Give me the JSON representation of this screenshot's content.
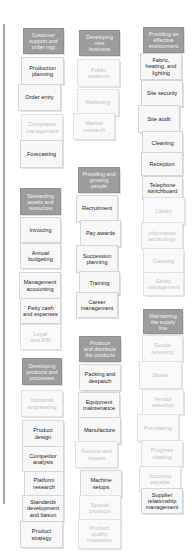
{
  "colors": {
    "header_bg": "#9c9c9c",
    "card_bg": "#f7f7f7",
    "active_text": "#1e1e1e",
    "faded_text": "#c2c2c2",
    "rule": "#a8a8a8"
  },
  "groups": [
    {
      "id": "customer",
      "header": "Customer\nsupport and\norder mgt",
      "items": [
        {
          "label": "Production\nplanning",
          "state": "active"
        },
        {
          "label": "Order entry",
          "state": "active"
        },
        {
          "label": "Complaints\nmanagement",
          "state": "faded"
        },
        {
          "label": "Forecasting",
          "state": "active"
        }
      ]
    },
    {
      "id": "new-business",
      "header": "Developing\nnew\nbusiness",
      "items": [
        {
          "label": "Public\nrelations",
          "state": "faded"
        },
        {
          "label": "Marketing",
          "state": "faded"
        },
        {
          "label": "Market\nresearch",
          "state": "faded"
        }
      ]
    },
    {
      "id": "environment",
      "header": "Providing an\neffective\nenvironment",
      "items": [
        {
          "label": "Fabric,\nheating, and\nlighting",
          "state": "active"
        },
        {
          "label": "Site security",
          "state": "active"
        },
        {
          "label": "Site audit",
          "state": "active"
        },
        {
          "label": "Cleaning",
          "state": "active"
        },
        {
          "label": "Reception",
          "state": "active"
        },
        {
          "label": "Telephone\nswitchboard",
          "state": "active"
        },
        {
          "label": "Library",
          "state": "faded"
        },
        {
          "label": "Information\ntechnology",
          "state": "faded"
        },
        {
          "label": "Catering",
          "state": "faded"
        },
        {
          "label": "Safety\nmanagement",
          "state": "faded"
        }
      ]
    },
    {
      "id": "stewarding",
      "header": "Stewarding\nassets and\nresources",
      "items": [
        {
          "label": "Invoicing",
          "state": "active"
        },
        {
          "label": "Annual\nbudgeting",
          "state": "active"
        },
        {
          "label": "Management\naccounting",
          "state": "active"
        },
        {
          "label": "Petty cash\nand expenses",
          "state": "active"
        },
        {
          "label": "Legal\nand IPR",
          "state": "faded"
        }
      ]
    },
    {
      "id": "people",
      "header": "Providing and\ngrowing\npeople",
      "items": [
        {
          "label": "Recruitment",
          "state": "active"
        },
        {
          "label": "Pay awards",
          "state": "active"
        },
        {
          "label": "Succession\nplanning",
          "state": "active"
        },
        {
          "label": "Training",
          "state": "active"
        },
        {
          "label": "Career\nmanagement",
          "state": "active"
        }
      ]
    },
    {
      "id": "supply",
      "header": "Maintaining\nthe supply\nline",
      "items": [
        {
          "label": "Goods\nreceiving",
          "state": "faded"
        },
        {
          "label": "Stores",
          "state": "faded"
        },
        {
          "label": "Vendor\nselection",
          "state": "faded"
        },
        {
          "label": "Purchasing",
          "state": "faded"
        },
        {
          "label": "Progress\nchasing",
          "state": "faded"
        },
        {
          "label": "Accounts\npayable",
          "state": "faded"
        },
        {
          "label": "Supplier\nrelationship\nmanagement",
          "state": "active"
        }
      ]
    },
    {
      "id": "products",
      "header": "Developing\nproducts and\nprocesses",
      "items": [
        {
          "label": "Industrial\nengineering",
          "state": "faded"
        },
        {
          "label": "Product\ndesign",
          "state": "active"
        },
        {
          "label": "Competitor\nanalysis",
          "state": "active"
        },
        {
          "label": "Platform\nresearch",
          "state": "active"
        },
        {
          "label": "Standards\ndevelopment\nand liaison",
          "state": "active"
        },
        {
          "label": "Product\nstrategy",
          "state": "active"
        }
      ]
    },
    {
      "id": "distribute",
      "header": "Produce\nand distribute\nthe products",
      "items": [
        {
          "label": "Packing and\ndespatch",
          "state": "active"
        },
        {
          "label": "Equipment\nmaintenance",
          "state": "active"
        },
        {
          "label": "Manufacture",
          "state": "active"
        },
        {
          "label": "Returns and\nrepairs",
          "state": "faded"
        },
        {
          "label": "Machine\nsetups",
          "state": "active"
        },
        {
          "label": "Special\nproducts",
          "state": "faded"
        },
        {
          "label": "Product\nquality\ninspection",
          "state": "faded"
        }
      ]
    }
  ]
}
